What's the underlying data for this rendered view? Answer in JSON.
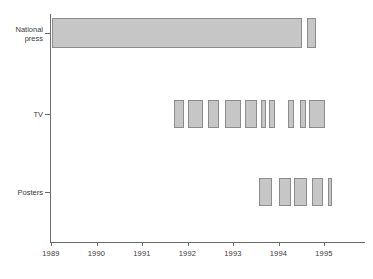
{
  "chart_data": {
    "type": "bar",
    "orientation": "horizontal-timeline",
    "title": "",
    "xlabel": "",
    "ylabel": "",
    "xlim": [
      1988.85,
      1995.75
    ],
    "grid": false,
    "legend": null,
    "x_ticks": [
      1989,
      1990,
      1991,
      1992,
      1993,
      1994,
      1995
    ],
    "x_tick_labels": [
      "1989",
      "1990",
      "1991",
      "1992",
      "1993",
      "1994",
      "1995"
    ],
    "categories": [
      "National press",
      "TV",
      "Posters"
    ],
    "series": [
      {
        "name": "National press",
        "label_lines": [
          "National",
          "press"
        ],
        "intervals": [
          {
            "start": 1989.03,
            "end": 1994.52
          },
          {
            "start": 1994.62,
            "end": 1994.82
          }
        ]
      },
      {
        "name": "TV",
        "label_lines": [
          "TV"
        ],
        "intervals": [
          {
            "start": 1991.7,
            "end": 1991.92
          },
          {
            "start": 1992.02,
            "end": 1992.35
          },
          {
            "start": 1992.45,
            "end": 1992.7
          },
          {
            "start": 1992.82,
            "end": 1993.18
          },
          {
            "start": 1993.27,
            "end": 1993.53
          },
          {
            "start": 1993.61,
            "end": 1993.72
          },
          {
            "start": 1993.8,
            "end": 1993.93
          },
          {
            "start": 1994.2,
            "end": 1994.33
          },
          {
            "start": 1994.48,
            "end": 1994.6
          },
          {
            "start": 1994.68,
            "end": 1995.02
          }
        ]
      },
      {
        "name": "Posters",
        "label_lines": [
          "Posters"
        ],
        "intervals": [
          {
            "start": 1993.58,
            "end": 1993.85
          },
          {
            "start": 1994.02,
            "end": 1994.27
          },
          {
            "start": 1994.34,
            "end": 1994.62
          },
          {
            "start": 1994.73,
            "end": 1994.98
          },
          {
            "start": 1995.08,
            "end": 1995.17
          }
        ]
      }
    ],
    "colors": {
      "bar_fill": "#c6c6c6",
      "bar_stroke": "#8c8c8c",
      "axis": "#6b6b6b",
      "text": "#3a3a3a",
      "background": "#ffffff"
    }
  }
}
